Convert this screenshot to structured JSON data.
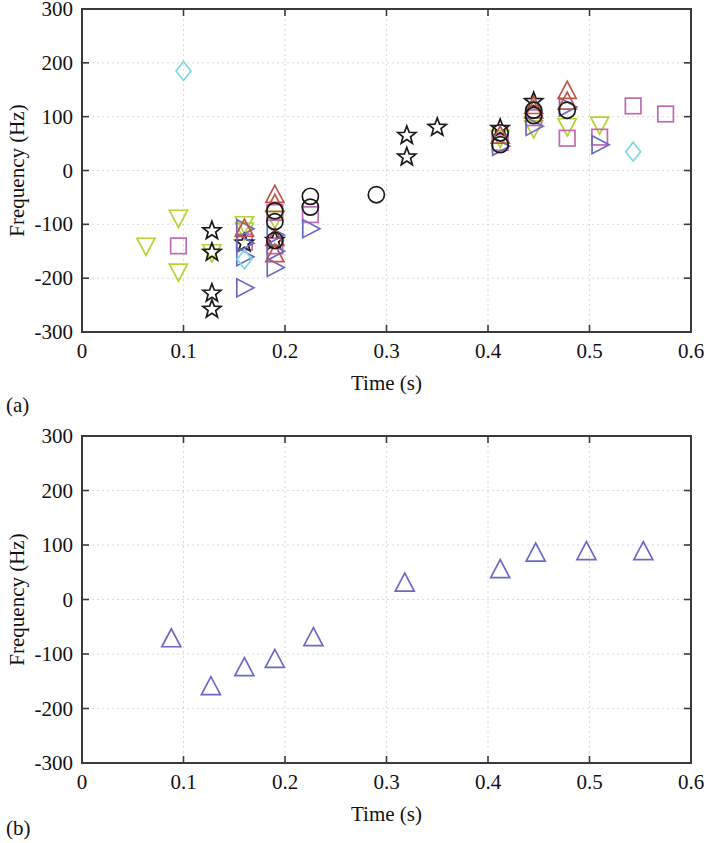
{
  "figure": {
    "background": "#ffffff",
    "panels": [
      {
        "id": "a",
        "label": "(a)"
      },
      {
        "id": "b",
        "label": "(b)"
      }
    ]
  },
  "axes": {
    "xlabel": "Time (s)",
    "ylabel": "Frequency (Hz)",
    "xticks": [
      "0",
      "0.1",
      "0.2",
      "0.3",
      "0.4",
      "0.5",
      "0.6"
    ],
    "xtickvalues": [
      0,
      0.1,
      0.2,
      0.3,
      0.4,
      0.5,
      0.6
    ],
    "yticks": [
      "300",
      "200",
      "100",
      "0",
      "-100",
      "-200",
      "-300"
    ],
    "ytickvalues": [
      300,
      200,
      100,
      0,
      -100,
      -200,
      -300
    ],
    "xlim": [
      0,
      0.6
    ],
    "ylim": [
      -300,
      300
    ],
    "grid": true
  },
  "colors": {
    "green": "#b5d335",
    "pink": "#c06bb0",
    "black": "#1a1a1a",
    "blue": "#6a6ac4",
    "red": "#c0544a",
    "cyan": "#7fd8e0",
    "magenta": "#c46aa8",
    "olive": "#a8c040",
    "axis": "#3a3a3a",
    "grid": "#cfcfd8"
  },
  "chart_data": [
    {
      "type": "scatter",
      "panel": "(a)",
      "title": "",
      "xlabel": "Time (s)",
      "ylabel": "Frequency (Hz)",
      "xlim": [
        0,
        0.6
      ],
      "ylim": [
        -300,
        300
      ],
      "grid": true,
      "legend": "none",
      "series": [
        {
          "name": "down-triangle-green",
          "marker": "triangle-down",
          "color": "#b5d335",
          "points": [
            [
              0.063,
              -140
            ],
            [
              0.095,
              -88
            ],
            [
              0.095,
              -188
            ],
            [
              0.128,
              -152
            ],
            [
              0.16,
              -100
            ],
            [
              0.16,
              -112
            ],
            [
              0.19,
              -90
            ],
            [
              0.412,
              60
            ],
            [
              0.445,
              78
            ],
            [
              0.478,
              82
            ],
            [
              0.51,
              85
            ]
          ]
        },
        {
          "name": "square-pink",
          "marker": "square",
          "color": "#c06bb0",
          "points": [
            [
              0.095,
              -140
            ],
            [
              0.16,
              -133
            ],
            [
              0.19,
              -78
            ],
            [
              0.19,
              -140
            ],
            [
              0.225,
              -82
            ],
            [
              0.412,
              52
            ],
            [
              0.445,
              98
            ],
            [
              0.478,
              60
            ],
            [
              0.51,
              62
            ],
            [
              0.543,
              120
            ],
            [
              0.575,
              105
            ]
          ]
        },
        {
          "name": "star-black",
          "marker": "star",
          "color": "#1a1a1a",
          "points": [
            [
              0.128,
              -112
            ],
            [
              0.128,
              -152
            ],
            [
              0.128,
              -228
            ],
            [
              0.128,
              -258
            ],
            [
              0.16,
              -135
            ],
            [
              0.19,
              -130
            ],
            [
              0.32,
              65
            ],
            [
              0.32,
              25
            ],
            [
              0.35,
              80
            ],
            [
              0.412,
              78
            ],
            [
              0.445,
              128
            ]
          ]
        },
        {
          "name": "triangle-right-blue",
          "marker": "triangle-right",
          "color": "#6a6ac4",
          "points": [
            [
              0.16,
              -108
            ],
            [
              0.16,
              -135
            ],
            [
              0.16,
              -160
            ],
            [
              0.16,
              -218
            ],
            [
              0.19,
              -120
            ],
            [
              0.19,
              -150
            ],
            [
              0.19,
              -180
            ],
            [
              0.225,
              -108
            ],
            [
              0.412,
              45
            ],
            [
              0.445,
              82
            ],
            [
              0.478,
              118
            ],
            [
              0.51,
              48
            ]
          ]
        },
        {
          "name": "triangle-up-red",
          "marker": "triangle-up",
          "color": "#c0544a",
          "points": [
            [
              0.16,
              -108
            ],
            [
              0.19,
              -45
            ],
            [
              0.19,
              -62
            ],
            [
              0.19,
              -125
            ],
            [
              0.19,
              -155
            ],
            [
              0.412,
              65
            ],
            [
              0.445,
              112
            ],
            [
              0.445,
              120
            ],
            [
              0.478,
              148
            ],
            [
              0.478,
              128
            ]
          ]
        },
        {
          "name": "circle-black",
          "marker": "circle",
          "color": "#1a1a1a",
          "points": [
            [
              0.19,
              -75
            ],
            [
              0.19,
              -95
            ],
            [
              0.19,
              -130
            ],
            [
              0.225,
              -48
            ],
            [
              0.225,
              -68
            ],
            [
              0.29,
              -45
            ],
            [
              0.412,
              70
            ],
            [
              0.412,
              48
            ],
            [
              0.445,
              102
            ],
            [
              0.445,
              112
            ],
            [
              0.478,
              112
            ]
          ]
        },
        {
          "name": "diamond-cyan",
          "marker": "diamond",
          "color": "#7fd8e0",
          "points": [
            [
              0.1,
              185
            ],
            [
              0.16,
              -165
            ],
            [
              0.543,
              35
            ]
          ]
        }
      ]
    },
    {
      "type": "scatter",
      "panel": "(b)",
      "title": "",
      "xlabel": "Time (s)",
      "ylabel": "Frequency (Hz)",
      "xlim": [
        0,
        0.6
      ],
      "ylim": [
        -300,
        300
      ],
      "grid": true,
      "legend": "none",
      "series": [
        {
          "name": "triangle-up-blue",
          "marker": "triangle-up",
          "color": "#6a6ac4",
          "points": [
            [
              0.088,
              -72
            ],
            [
              0.127,
              -160
            ],
            [
              0.16,
              -125
            ],
            [
              0.19,
              -110
            ],
            [
              0.228,
              -70
            ],
            [
              0.318,
              30
            ],
            [
              0.412,
              55
            ],
            [
              0.447,
              85
            ],
            [
              0.497,
              88
            ],
            [
              0.553,
              88
            ]
          ]
        }
      ]
    }
  ]
}
